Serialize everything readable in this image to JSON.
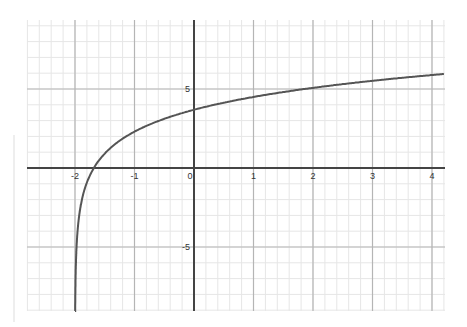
{
  "chart_data": {
    "type": "line",
    "title": "",
    "xlabel": "",
    "ylabel": "",
    "xlim": [
      -2.8,
      4.2
    ],
    "ylim": [
      -9.2,
      9.2
    ],
    "x_ticks": [
      -2,
      -1,
      0,
      1,
      2,
      3,
      4
    ],
    "x_tick_labels": [
      "-2",
      "-1",
      "0",
      "1",
      "2",
      "3",
      "4"
    ],
    "y_ticks": [
      5,
      -5
    ],
    "y_tick_labels": [
      "5",
      "-5"
    ],
    "grid": true,
    "minor_grid": {
      "x_step": 0.2,
      "y_step": 1
    },
    "legend": null,
    "series": [
      {
        "name": "f(x)",
        "formula_estimate": "y = 2*ln(x+2) + 2.3",
        "vertical_asymptote": -2,
        "x_intercept": -1.68,
        "y_intercept": 3.7,
        "points": [
          {
            "x": -1.99,
            "y": -6.9
          },
          {
            "x": -1.95,
            "y": -3.7
          },
          {
            "x": -1.9,
            "y": -2.3
          },
          {
            "x": -1.8,
            "y": -0.9
          },
          {
            "x": -1.68,
            "y": 0
          },
          {
            "x": -1.5,
            "y": 0.9
          },
          {
            "x": -1,
            "y": 2.3
          },
          {
            "x": 0,
            "y": 3.7
          },
          {
            "x": 1,
            "y": 4.5
          },
          {
            "x": 2,
            "y": 5.1
          },
          {
            "x": 3,
            "y": 5.5
          },
          {
            "x": 4,
            "y": 5.9
          },
          {
            "x": 4.2,
            "y": 5.95
          }
        ]
      }
    ]
  },
  "colors": {
    "curve": "#555555",
    "axis": "#444444",
    "major_grid": "#b5b5b5",
    "minor_grid": "#e6e6e6"
  }
}
